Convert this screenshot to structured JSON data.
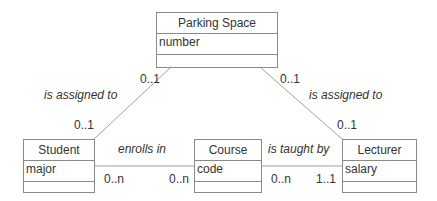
{
  "classes": {
    "parking_space": {
      "name": "Parking Space",
      "attributes": [
        "number"
      ]
    },
    "student": {
      "name": "Student",
      "attributes": [
        "major"
      ]
    },
    "course": {
      "name": "Course",
      "attributes": [
        "code"
      ]
    },
    "lecturer": {
      "name": "Lecturer",
      "attributes": [
        "salary"
      ]
    }
  },
  "associations": {
    "student_parking": {
      "label": "is assigned to",
      "mult_student": "0..1",
      "mult_parking": "0..1"
    },
    "lecturer_parking": {
      "label": "is assigned to",
      "mult_lecturer": "0..1",
      "mult_parking": "0..1"
    },
    "student_course": {
      "label": "enrolls in",
      "mult_student": "0..n",
      "mult_course": "0..n"
    },
    "course_lecturer": {
      "label": "is taught by",
      "mult_course": "0..n",
      "mult_lecturer": "1..1"
    }
  },
  "colors": {
    "line": "#a0a0a0",
    "border": "#8a8a8a",
    "text": "#333333"
  }
}
